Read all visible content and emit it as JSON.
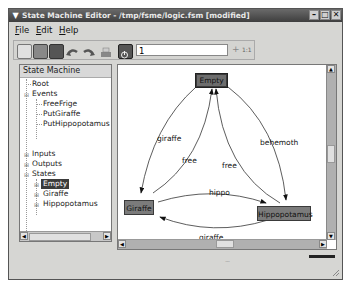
{
  "window": {
    "title": "State Machine Editor - /tmp/fsme/logic.fsm [modified]",
    "controls": [
      "minimize",
      "maximize",
      "close"
    ]
  },
  "menubar": {
    "items": [
      {
        "label": "File",
        "mnemonic": "F"
      },
      {
        "label": "Edit",
        "mnemonic": "E"
      },
      {
        "label": "Help",
        "mnemonic": "H"
      }
    ]
  },
  "toolbar": {
    "buttons": [
      "new-icon",
      "open-icon",
      "save-icon",
      "undo-icon",
      "redo-icon",
      "print-icon",
      "power-icon"
    ],
    "zoom_value": "1",
    "zoom_in_label": "+",
    "zoom_reset_label": "1:1"
  },
  "tree": {
    "header": "State Machine",
    "nodes": [
      {
        "label": "Root",
        "level": 1
      },
      {
        "label": "Events",
        "level": 1,
        "expanded": true
      },
      {
        "label": "FreeFrige",
        "level": 2
      },
      {
        "label": "PutGiraffe",
        "level": 2
      },
      {
        "label": "PutHippopotamus",
        "level": 2
      },
      {
        "label": "Inputs",
        "level": 1,
        "expanded": false
      },
      {
        "label": "Outputs",
        "level": 1,
        "expanded": false
      },
      {
        "label": "States",
        "level": 1,
        "expanded": true
      },
      {
        "label": "Empty",
        "level": 2,
        "selected": true
      },
      {
        "label": "Giraffe",
        "level": 2
      },
      {
        "label": "Hippopotamus",
        "level": 2
      }
    ]
  },
  "diagram": {
    "states": [
      {
        "name": "Empty",
        "selected": true
      },
      {
        "name": "Giraffe"
      },
      {
        "name": "Hippopotamus"
      }
    ],
    "transitions": [
      {
        "from": "Empty",
        "to": "Giraffe",
        "label": "giraffe"
      },
      {
        "from": "Giraffe",
        "to": "Empty",
        "label": "free"
      },
      {
        "from": "Hippopotamus",
        "to": "Empty",
        "label": "free"
      },
      {
        "from": "Empty",
        "to": "Hippopotamus",
        "label": "behemoth"
      },
      {
        "from": "Giraffe",
        "to": "Hippopotamus",
        "label": "hippo"
      },
      {
        "from": "Hippopotamus",
        "to": "Giraffe",
        "label": "giraffe"
      }
    ]
  }
}
